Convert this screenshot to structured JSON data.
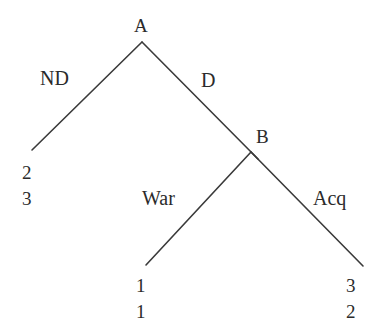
{
  "figure": {
    "type": "extensive-form-game-tree",
    "background_color": "#ffffff",
    "line_color": "#3a3a3a",
    "text_color": "#2b2b2b"
  },
  "nodes": [
    {
      "id": "A",
      "label": "A",
      "x": 142,
      "y": 42,
      "label_x": 134,
      "label_y": 16
    },
    {
      "id": "B",
      "label": "B",
      "x": 251,
      "y": 152,
      "label_x": 256,
      "label_y": 127
    }
  ],
  "edges": [
    {
      "id": "nd",
      "from": "A",
      "to": "outcome-left",
      "label": "ND",
      "label_x": 40,
      "label_y": 68,
      "x1": 142,
      "y1": 42,
      "x2": 32,
      "y2": 150
    },
    {
      "id": "d",
      "from": "A",
      "to": "B",
      "label": "D",
      "label_x": 201,
      "label_y": 70,
      "x1": 142,
      "y1": 42,
      "x2": 258,
      "y2": 159
    },
    {
      "id": "war",
      "from": "B",
      "to": "outcome-center",
      "label": "War",
      "label_x": 142,
      "label_y": 188,
      "x1": 251,
      "y1": 152,
      "x2": 146,
      "y2": 265
    },
    {
      "id": "acq",
      "from": "B",
      "to": "outcome-right",
      "label": "Acq",
      "label_x": 313,
      "label_y": 188,
      "x1": 251,
      "y1": 152,
      "x2": 363,
      "y2": 266
    }
  ],
  "outcomes": [
    {
      "id": "outcome-left",
      "x": 22,
      "y": 162,
      "payoffs": [
        "2",
        "3"
      ]
    },
    {
      "id": "outcome-center",
      "x": 136,
      "y": 275,
      "payoffs": [
        "1",
        "1"
      ]
    },
    {
      "id": "outcome-right",
      "x": 346,
      "y": 275,
      "payoffs": [
        "3",
        "2"
      ]
    }
  ]
}
